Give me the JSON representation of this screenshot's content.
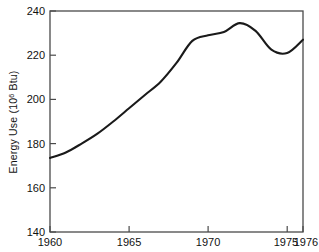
{
  "chart_data": {
    "type": "line",
    "title": "",
    "xlabel": "",
    "ylabel": "Energy Use (10⁶ Btu)",
    "ylabel_base": "Energy Use (10",
    "ylabel_exponent": "6",
    "ylabel_tail": " Btu)",
    "xlim": [
      1960,
      1976
    ],
    "ylim": [
      140,
      240
    ],
    "grid": false,
    "legend": null,
    "line_color": "#1a1a1a",
    "frame_color": "#4a4a4a",
    "background_color": "#ffffff",
    "x_ticks": [
      1960,
      1965,
      1970,
      1975,
      1976
    ],
    "x_tick_labels": [
      "1960",
      "1965",
      "1970",
      "1975",
      "1976"
    ],
    "x_major_ticks": [
      1960,
      1965,
      1970,
      1975,
      1976
    ],
    "y_ticks": [
      140,
      160,
      180,
      200,
      220,
      240
    ],
    "y_tick_labels": [
      "140",
      "160",
      "180",
      "200",
      "220",
      "240"
    ],
    "x": [
      1960,
      1961,
      1962,
      1963,
      1964,
      1965,
      1966,
      1967,
      1968,
      1969,
      1970,
      1971,
      1972,
      1973,
      1974,
      1975,
      1976
    ],
    "values": [
      173.5,
      176.0,
      180.0,
      184.5,
      190.0,
      196.0,
      202.0,
      208.0,
      216.5,
      226.5,
      229.0,
      230.5,
      234.5,
      231.0,
      222.5,
      221.0,
      227.0
    ],
    "series": [
      {
        "name": "Energy Use",
        "values": [
          173.5,
          176.0,
          180.0,
          184.5,
          190.0,
          196.0,
          202.0,
          208.0,
          216.5,
          226.5,
          229.0,
          230.5,
          234.5,
          231.0,
          222.5,
          221.0,
          227.0
        ]
      }
    ]
  }
}
